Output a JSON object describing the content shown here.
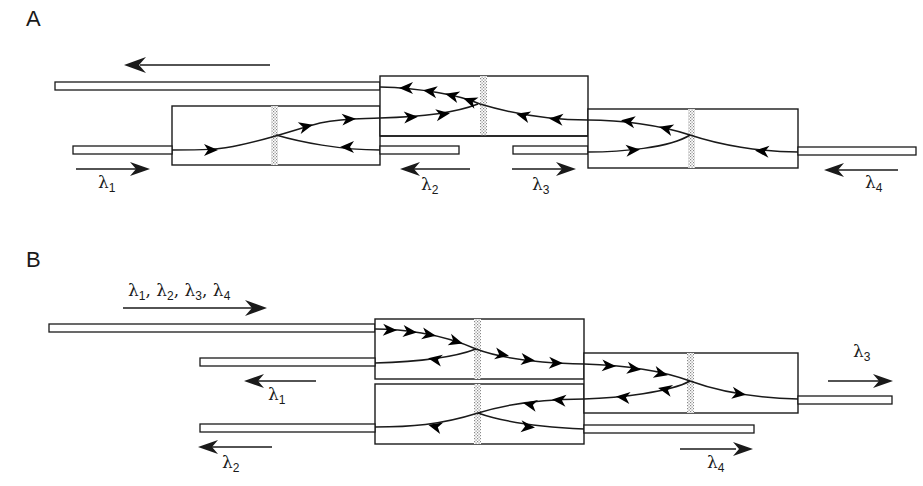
{
  "figure": {
    "panels": [
      {
        "id": "A",
        "label": "A",
        "description": "Cascaded grating couplers: wavelengths enter from different ports and are combined onto one output fiber",
        "labels": [
          {
            "id": "l1",
            "symbol": "λ",
            "sub": "1",
            "x": 98,
            "y": 172
          },
          {
            "id": "l2",
            "symbol": "λ",
            "sub": "2",
            "x": 420,
            "y": 174
          },
          {
            "id": "l3",
            "symbol": "λ",
            "sub": "3",
            "x": 533,
            "y": 174
          },
          {
            "id": "l4",
            "symbol": "λ",
            "sub": "4",
            "x": 865,
            "y": 172
          }
        ]
      },
      {
        "id": "B",
        "label": "B",
        "description": "Cascaded grating couplers: multiplexed input split into individual wavelength outputs",
        "labels": [
          {
            "id": "lin",
            "symbol": "λ",
            "sub": "1",
            "text": "λ1, λ2, λ3, λ4",
            "x": 128,
            "y": 282
          },
          {
            "id": "l1",
            "symbol": "λ",
            "sub": "1",
            "x": 268,
            "y": 384
          },
          {
            "id": "l2",
            "symbol": "λ",
            "sub": "2",
            "x": 222,
            "y": 452
          },
          {
            "id": "l3",
            "symbol": "λ",
            "sub": "3",
            "x": 853,
            "y": 342
          },
          {
            "id": "l4",
            "symbol": "λ",
            "sub": "4",
            "x": 707,
            "y": 452
          }
        ]
      }
    ],
    "multiplex_label": {
      "parts": [
        {
          "sym": "λ",
          "sub": "1",
          "sep": ", "
        },
        {
          "sym": "λ",
          "sub": "2",
          "sep": ", "
        },
        {
          "sym": "λ",
          "sub": "3",
          "sep": ", "
        },
        {
          "sym": "λ",
          "sub": "4",
          "sep": ""
        }
      ]
    },
    "colors": {
      "ink": "#1a1a1a",
      "background": "#ffffff",
      "grating": "#9a9a9a"
    }
  }
}
